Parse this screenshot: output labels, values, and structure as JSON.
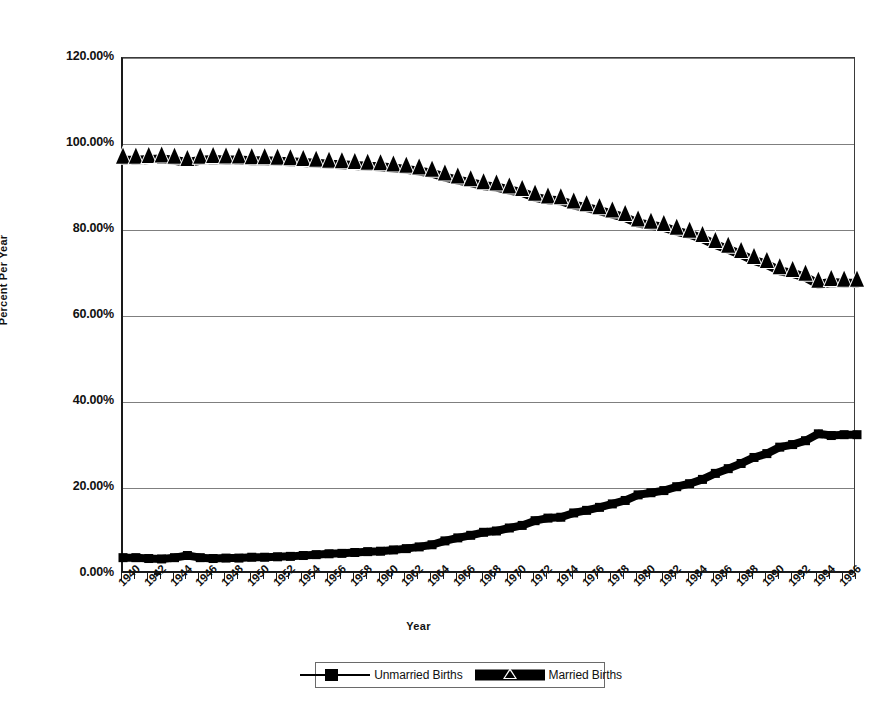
{
  "chart_data": {
    "type": "line",
    "title": "",
    "xlabel": "Year",
    "ylabel": "Percent Per Year",
    "ylim": [
      0,
      120
    ],
    "ytick_labels": [
      "0.00%",
      "20.00%",
      "40.00%",
      "60.00%",
      "80.00%",
      "100.00%",
      "120.00%"
    ],
    "ytick_values": [
      0,
      20,
      40,
      60,
      80,
      100,
      120
    ],
    "grid": true,
    "legend_position": "bottom",
    "xlim": [
      1940,
      1997
    ],
    "x": [
      1940,
      1941,
      1942,
      1943,
      1944,
      1945,
      1946,
      1947,
      1948,
      1949,
      1950,
      1951,
      1952,
      1953,
      1954,
      1955,
      1956,
      1957,
      1958,
      1959,
      1960,
      1961,
      1962,
      1963,
      1964,
      1965,
      1966,
      1967,
      1968,
      1969,
      1970,
      1971,
      1972,
      1973,
      1974,
      1975,
      1976,
      1977,
      1978,
      1979,
      1980,
      1981,
      1982,
      1983,
      1984,
      1985,
      1986,
      1987,
      1988,
      1989,
      1990,
      1991,
      1992,
      1993,
      1994,
      1995,
      1996,
      1997
    ],
    "xtick_labels": [
      "1940",
      "1942",
      "1944",
      "1946",
      "1948",
      "1950",
      "1952",
      "1954",
      "1956",
      "1958",
      "1960",
      "1962",
      "1964",
      "1966",
      "1968",
      "1970",
      "1972",
      "1974",
      "1976",
      "1978",
      "1980",
      "1982",
      "1984",
      "1986",
      "1988",
      "1990",
      "1992",
      "1994",
      "1996"
    ],
    "series": [
      {
        "name": "Unmarried Births",
        "marker": "square",
        "color": "#000000",
        "values": [
          3.8,
          3.8,
          3.6,
          3.5,
          3.8,
          4.3,
          3.8,
          3.6,
          3.7,
          3.7,
          3.9,
          3.9,
          4.0,
          4.1,
          4.3,
          4.5,
          4.7,
          4.8,
          5.0,
          5.2,
          5.3,
          5.6,
          5.9,
          6.3,
          6.8,
          7.7,
          8.4,
          9.0,
          9.7,
          10.0,
          10.7,
          11.3,
          12.4,
          13.0,
          13.2,
          14.2,
          14.8,
          15.5,
          16.3,
          17.1,
          18.4,
          18.9,
          19.4,
          20.3,
          21.0,
          22.0,
          23.4,
          24.5,
          25.7,
          27.1,
          28.0,
          29.5,
          30.1,
          31.0,
          32.6,
          32.2,
          32.4,
          32.4
        ]
      },
      {
        "name": "Married Births",
        "marker": "triangle",
        "color": "#000000",
        "values": [
          96.2,
          96.2,
          96.4,
          96.5,
          96.2,
          95.7,
          96.2,
          96.4,
          96.3,
          96.3,
          96.1,
          96.1,
          96.0,
          95.9,
          95.7,
          95.5,
          95.3,
          95.2,
          95.0,
          94.8,
          94.7,
          94.4,
          94.1,
          93.7,
          93.2,
          92.3,
          91.6,
          91.0,
          90.3,
          90.0,
          89.3,
          88.7,
          87.6,
          87.0,
          86.8,
          85.8,
          85.2,
          84.5,
          83.7,
          82.9,
          81.6,
          81.1,
          80.6,
          79.7,
          79.0,
          78.0,
          76.6,
          75.5,
          74.3,
          72.9,
          72.0,
          70.5,
          69.9,
          69.0,
          67.4,
          67.8,
          67.6,
          67.6
        ]
      }
    ]
  },
  "legend": {
    "entries": [
      {
        "label": "Unmarried Births",
        "marker": "square"
      },
      {
        "label": "Married Births",
        "marker": "triangle"
      }
    ]
  }
}
